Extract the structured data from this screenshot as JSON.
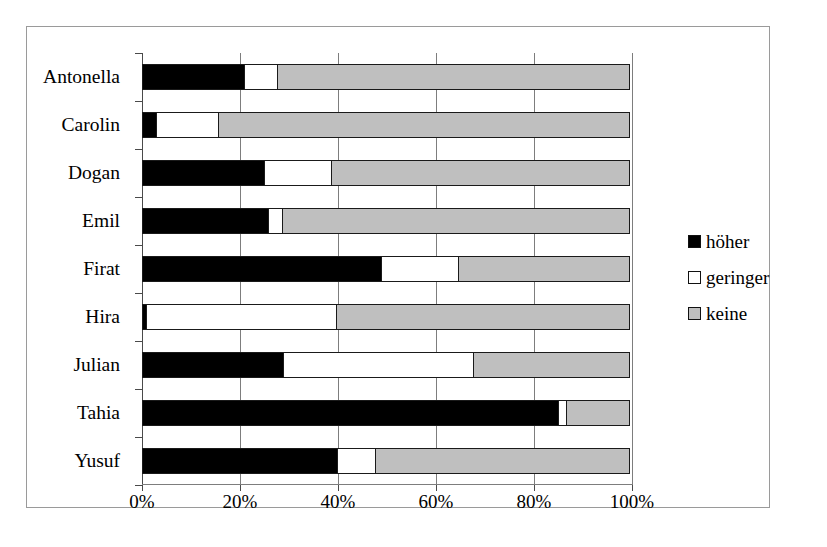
{
  "figure": {
    "border_color": "#9a9a9a"
  },
  "chart_data": {
    "type": "bar",
    "orientation": "horizontal",
    "stacked": true,
    "normalized": "percent",
    "title": "",
    "subtitle": "",
    "xlabel": "",
    "ylabel": "",
    "grid": true,
    "xlim": [
      0,
      100
    ],
    "xticks": [
      0,
      20,
      40,
      60,
      80,
      100
    ],
    "xtick_labels": [
      "0%",
      "20%",
      "40%",
      "60%",
      "80%",
      "100%"
    ],
    "legend_position": "right",
    "categories": [
      "Antonella",
      "Carolin",
      "Dogan",
      "Emil",
      "Firat",
      "Hira",
      "Julian",
      "Tahia",
      "Yusuf"
    ],
    "series": [
      {
        "name": "höher",
        "color": "#000000",
        "values": [
          21,
          3,
          25,
          26,
          49,
          1,
          29,
          85,
          40
        ]
      },
      {
        "name": "geringer",
        "color": "#ffffff",
        "values": [
          7,
          13,
          14,
          3,
          16,
          39,
          39,
          2,
          8
        ]
      },
      {
        "name": "keine",
        "color": "#bfbfbf",
        "values": [
          72,
          84,
          61,
          71,
          35,
          60,
          32,
          13,
          52
        ]
      }
    ]
  },
  "legend": {
    "items": [
      {
        "label": "höher",
        "swatch_class": "sw-hoeher"
      },
      {
        "label": "geringer",
        "swatch_class": "sw-geringer"
      },
      {
        "label": "keine",
        "swatch_class": "sw-keine"
      }
    ]
  }
}
